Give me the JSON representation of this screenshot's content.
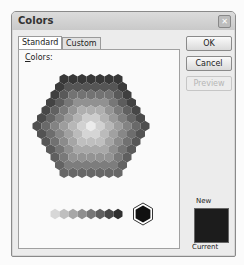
{
  "window": {
    "title": "Colors",
    "close_icon": "close-icon"
  },
  "tabs": [
    {
      "label": "Standard",
      "selected": true
    },
    {
      "label": "Custom",
      "selected": false
    }
  ],
  "panel": {
    "colors_label_accel": "C",
    "colors_label_rest": "olors:"
  },
  "buttons": {
    "ok": "OK",
    "cancel": "Cancel",
    "preview": "Preview"
  },
  "preview": {
    "new_label": "New",
    "current_label": "Current",
    "new_color": "#1c1c1c",
    "current_color": "#1c1c1c"
  },
  "palette": {
    "selected_color": "#111111",
    "type": "grayscale-hexagon"
  }
}
